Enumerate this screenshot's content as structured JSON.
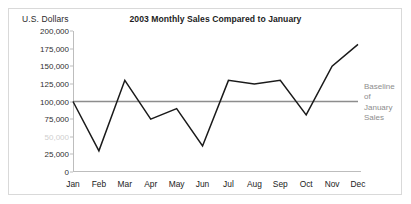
{
  "axis_title": "U.S. Dollars",
  "annotation": {
    "lines": [
      "Baseline",
      "of",
      "January",
      "Sales"
    ],
    "color": "#8d8d8d"
  },
  "chart_data": {
    "type": "line",
    "title": "2003 Monthly Sales Compared to January",
    "xlabel": "",
    "ylabel": "U.S. Dollars",
    "categories": [
      "Jan",
      "Feb",
      "Mar",
      "Apr",
      "May",
      "Jun",
      "Jul",
      "Aug",
      "Sep",
      "Oct",
      "Nov",
      "Dec"
    ],
    "series": [
      {
        "name": "2003 Monthly Sales",
        "color": "#1a1a1a",
        "values": [
          100000,
          30000,
          130000,
          75000,
          90000,
          37000,
          130000,
          125000,
          130000,
          81000,
          150000,
          181000
        ]
      }
    ],
    "reference_line": {
      "label": "Baseline of January Sales",
      "value": 100000,
      "color": "#8d8d8d"
    },
    "ylim": [
      0,
      200000
    ],
    "yticks": [
      0,
      25000,
      50000,
      75000,
      100000,
      125000,
      150000,
      175000,
      200000
    ],
    "ytick_labels": [
      "0",
      "25,000",
      "50,000",
      "75,000",
      "100,000",
      "125,000",
      "150,000",
      "175,000",
      "200,000"
    ],
    "faded_ytick_labels": [
      "50,000"
    ],
    "grid": false,
    "legend": "none"
  }
}
